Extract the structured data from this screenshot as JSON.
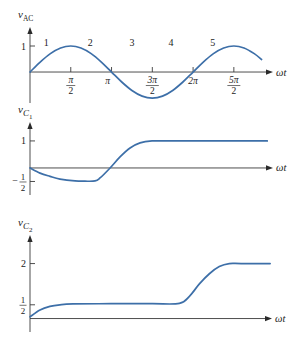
{
  "chart_data": [
    {
      "type": "line",
      "title": "",
      "ylabel": {
        "symbol": "v",
        "subscript": "AC",
        "subsubscript": ""
      },
      "xlabel": "ωt",
      "x_unit": "π",
      "xlim": [
        0,
        2.98
      ],
      "ylim": [
        -1.19,
        1.73
      ],
      "grid": false,
      "legend": "none",
      "x_ticks": [
        {
          "value": 0.5,
          "numerator": "π",
          "denominator": "2"
        },
        {
          "value": 1.0,
          "label": "π"
        },
        {
          "value": 1.5,
          "numerator": "3π",
          "denominator": "2"
        },
        {
          "value": 2.0,
          "label": "2π"
        },
        {
          "value": 2.5,
          "numerator": "5π",
          "denominator": "2"
        }
      ],
      "y_ticks": [
        {
          "value": 1,
          "label": "1"
        }
      ],
      "annotations": [
        {
          "text": "1",
          "x": 0.2,
          "y": 1.15
        },
        {
          "text": "2",
          "x": 0.74,
          "y": 1.15
        },
        {
          "text": "3",
          "x": 1.25,
          "y": 1.15
        },
        {
          "text": "4",
          "x": 1.73,
          "y": 1.15
        },
        {
          "text": "5",
          "x": 2.24,
          "y": 1.15
        }
      ],
      "series": [
        {
          "name": "v_AC",
          "color": "#3d6fa8",
          "x": [
            0,
            0.125,
            0.25,
            0.375,
            0.5,
            0.625,
            0.75,
            0.875,
            1.0,
            1.125,
            1.25,
            1.375,
            1.5,
            1.625,
            1.75,
            1.875,
            2.0,
            2.125,
            2.25,
            2.375,
            2.5,
            2.625,
            2.75,
            2.84
          ],
          "y": [
            0,
            0.383,
            0.707,
            0.924,
            1,
            0.924,
            0.707,
            0.383,
            0,
            -0.383,
            -0.707,
            -0.924,
            -1,
            -0.924,
            -0.707,
            -0.383,
            0,
            0.383,
            0.707,
            0.924,
            1,
            0.924,
            0.707,
            0.482
          ]
        }
      ]
    },
    {
      "type": "line",
      "title": "",
      "ylabel": {
        "symbol": "v",
        "subscript": "C",
        "subsubscript": "1"
      },
      "xlabel": "ωt",
      "x_unit": "π",
      "xlim": [
        0,
        2.98
      ],
      "ylim": [
        -1.0,
        1.7
      ],
      "grid": false,
      "legend": "none",
      "x_ticks": [],
      "y_ticks": [
        {
          "value": 1,
          "label": "1"
        },
        {
          "value": -0.5,
          "sign": "−",
          "numerator": "1",
          "denominator": "2"
        }
      ],
      "annotations": [],
      "series": [
        {
          "name": "v_C1",
          "color": "#3d6fa8",
          "x": [
            0,
            0.123,
            0.245,
            0.368,
            0.552,
            0.675,
            0.798,
            0.859,
            0.982,
            1.104,
            1.227,
            1.35,
            1.497,
            1.7,
            2.91
          ],
          "y": [
            0,
            -0.19,
            -0.31,
            -0.41,
            -0.48,
            -0.49,
            -0.48,
            -0.37,
            0,
            0.41,
            0.74,
            0.93,
            1.0,
            1.0,
            1.0
          ]
        }
      ]
    },
    {
      "type": "line",
      "title": "",
      "ylabel": {
        "symbol": "v",
        "subscript": "C",
        "subsubscript": "2"
      },
      "xlabel": "ωt",
      "x_unit": "π",
      "xlim": [
        0,
        2.98
      ],
      "ylim": [
        -0.49,
        3.04
      ],
      "grid": false,
      "legend": "none",
      "x_ticks": [],
      "y_ticks": [
        {
          "value": 2,
          "label": "2"
        },
        {
          "value": 0.5,
          "numerator": "1",
          "denominator": "2"
        }
      ],
      "annotations": [],
      "series": [
        {
          "name": "v_C2",
          "color": "#3d6fa8",
          "x": [
            0,
            0.123,
            0.245,
            0.368,
            0.528,
            1.0,
            1.5,
            1.84,
            1.963,
            2.086,
            2.209,
            2.331,
            2.454,
            2.6,
            2.957
          ],
          "y": [
            0.06,
            0.31,
            0.44,
            0.5,
            0.53,
            0.54,
            0.54,
            0.55,
            0.81,
            1.26,
            1.63,
            1.89,
            2.0,
            2.0,
            2.0
          ]
        }
      ]
    }
  ]
}
